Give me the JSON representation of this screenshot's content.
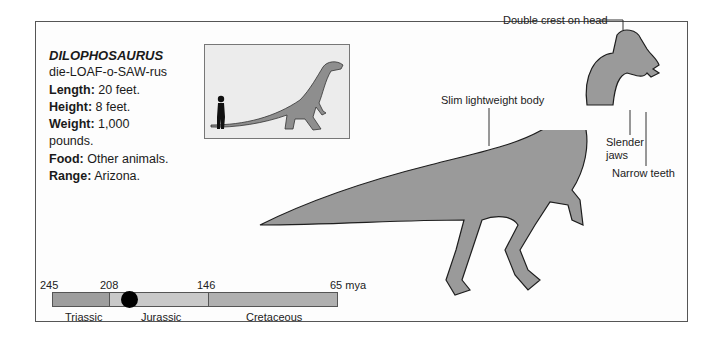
{
  "card": {
    "name": "DILOPHOSAURUS",
    "pronunciation": "die-LOAF-o-SAW-rus",
    "facts": [
      {
        "label": "Length:",
        "value": " 20 feet."
      },
      {
        "label": "Height:",
        "value": " 8 feet."
      },
      {
        "label": "Weight:",
        "value": " 1,000"
      },
      {
        "label": "",
        "value": "pounds."
      },
      {
        "label": "Food:",
        "value": " Other animals."
      },
      {
        "label": "Range:",
        "value": " Arizona."
      }
    ]
  },
  "illustration": {
    "annotations": {
      "crest": "Double crest on head",
      "body": "Slim lightweight body",
      "jaws_line1": "Slender",
      "jaws_line2": "jaws",
      "teeth": "Narrow teeth"
    },
    "colors": {
      "body": "#9a9a9a",
      "outline": "#1e1e1e",
      "inset_bg": "#ececec"
    }
  },
  "timeline": {
    "ticks": [
      "245",
      "208",
      "146",
      "65 mya"
    ],
    "periods": [
      {
        "name": "Triassic",
        "color": "#9e9e9e"
      },
      {
        "name": "Jurassic",
        "color": "#c9c9c9"
      },
      {
        "name": "Cretaceous",
        "color": "#b0b0b0"
      }
    ],
    "marker": "filled-circle"
  }
}
